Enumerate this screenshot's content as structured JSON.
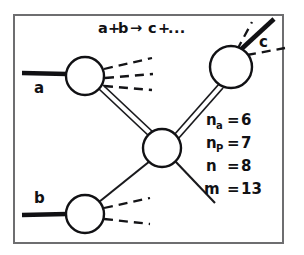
{
  "figure": {
    "title_equation": {
      "left": "a",
      "plus1": "+",
      "right": "b",
      "arrow": "→",
      "product": "c",
      "plus2": "+",
      "ellipsis": "..."
    },
    "incoming_particles": [
      {
        "label": "a",
        "name": "particle-a"
      },
      {
        "label": "b",
        "name": "particle-b"
      }
    ],
    "outgoing_particles": [
      {
        "label": "c",
        "name": "particle-c"
      }
    ],
    "legend": [
      {
        "symbol": "n",
        "subscript": "a",
        "equals": "=",
        "value": "6"
      },
      {
        "symbol": "n",
        "subscript": "P",
        "equals": "=",
        "value": "7"
      },
      {
        "symbol": "n",
        "subscript": "",
        "equals": "=",
        "value": "8"
      },
      {
        "symbol": "m",
        "subscript": "",
        "equals": "=",
        "value": "13"
      }
    ],
    "colors": {
      "ink": "#111114",
      "frame": "#6e6e70",
      "background": "#ffffff"
    },
    "vertices": [
      {
        "name": "blob-a",
        "cx": 85,
        "cy": 76,
        "r": 19
      },
      {
        "name": "blob-b",
        "cx": 85,
        "cy": 214,
        "r": 19
      },
      {
        "name": "blob-center",
        "cx": 162,
        "cy": 148,
        "r": 19
      },
      {
        "name": "blob-c",
        "cx": 231,
        "cy": 67,
        "r": 21
      }
    ]
  }
}
